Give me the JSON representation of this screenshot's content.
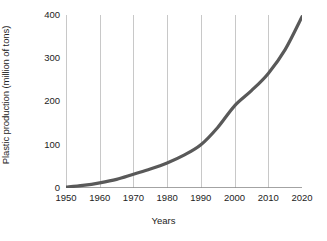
{
  "chart_data": {
    "type": "line",
    "title": "",
    "xlabel": "Years",
    "ylabel": "Plastic production (million of tons)",
    "xlim": [
      1950,
      2020
    ],
    "ylim": [
      0,
      400
    ],
    "xticks": [
      1950,
      1960,
      1970,
      1980,
      1990,
      2000,
      2010,
      2020
    ],
    "xtick_labels": [
      "1950",
      "1960",
      "1970",
      "1980",
      "1990",
      "2000",
      "2010",
      "2020"
    ],
    "yticks": [
      0,
      100,
      200,
      300,
      400
    ],
    "ytick_labels": [
      "0",
      "100",
      "200",
      "300",
      "400"
    ],
    "grid": "vertical",
    "legend": "none",
    "series": [
      {
        "name": "Plastic production",
        "color": "#595959",
        "line_width": 3.2,
        "x": [
          1950,
          1955,
          1960,
          1965,
          1970,
          1975,
          1980,
          1985,
          1990,
          1995,
          2000,
          2005,
          2010,
          2015,
          2020
        ],
        "values": [
          2,
          6,
          12,
          20,
          32,
          44,
          58,
          76,
          100,
          140,
          190,
          225,
          265,
          320,
          396
        ]
      }
    ],
    "annotations": []
  },
  "axes": {
    "y_title": "Plastic production (million of tons)",
    "x_title": "Years"
  },
  "style": {
    "line_color": "#595959",
    "grid_color": "#c8c8c8",
    "axis_color": "#8c8c8c",
    "text_color": "#232323",
    "background": "#ffffff"
  }
}
